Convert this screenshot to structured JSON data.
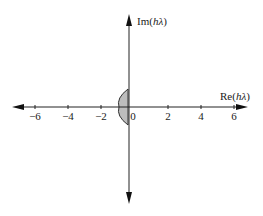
{
  "figure": {
    "x_axis": {
      "label_prefix": "Re(",
      "label_var": "hλ",
      "label_suffix": ")",
      "ticks": [
        {
          "value": -6,
          "label": "−6"
        },
        {
          "value": -4,
          "label": "−4"
        },
        {
          "value": -2,
          "label": "−2"
        },
        {
          "value": 0,
          "label": "0"
        },
        {
          "value": 2,
          "label": "2"
        },
        {
          "value": 4,
          "label": "4"
        },
        {
          "value": 6,
          "label": "6"
        }
      ]
    },
    "y_axis": {
      "label_prefix": "Im(",
      "label_var": "hλ",
      "label_suffix": ")"
    },
    "region": {
      "description": "stability region: small half-disk left of imaginary axis",
      "fill": "#bdbdbd",
      "stroke": "#333333",
      "re_min": -0.55,
      "im_range": [
        -1.1,
        1.1
      ]
    },
    "colors": {
      "axis": "#222222"
    }
  }
}
